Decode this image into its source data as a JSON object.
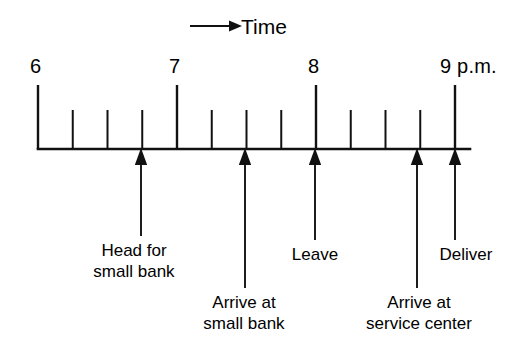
{
  "figure": {
    "type": "timeline",
    "caption": "Time",
    "direction_icon": "right-arrow-icon",
    "background_color": "#ffffff",
    "ink_color": "#111111"
  },
  "axis": {
    "baseline_y": 149,
    "x_start": 38,
    "x_end": 470,
    "hour_pixel_spacing": 139,
    "quarter_pixel_spacing": 34.75,
    "major_tick_height": 64,
    "minor_tick_height": 39,
    "hour_labels": [
      {
        "text": "6",
        "x": 38,
        "label_x": 30,
        "label_y": 56
      },
      {
        "text": "7",
        "x": 177,
        "label_x": 169,
        "label_y": 56
      },
      {
        "text": "8",
        "x": 316,
        "label_x": 308,
        "label_y": 56
      },
      {
        "text": "9 p.m.",
        "x": 455,
        "label_x": 440,
        "label_y": 56
      }
    ],
    "major_ticks": [
      38,
      177,
      316,
      455
    ],
    "minor_ticks": [
      72.75,
      107.5,
      142.25,
      211.75,
      246.5,
      281.25,
      350.75,
      385.5,
      420.25
    ]
  },
  "events": [
    {
      "name": "head-for-small-bank",
      "lines": [
        "Head for",
        "small bank"
      ],
      "arrow_x": 141,
      "stem_top_y": 236,
      "label_x": 134,
      "label_y": 240,
      "tier": "near"
    },
    {
      "name": "arrive-at-small-bank",
      "lines": [
        "Arrive at",
        "small bank"
      ],
      "arrow_x": 245,
      "stem_top_y": 288,
      "label_x": 244,
      "label_y": 292,
      "tier": "far"
    },
    {
      "name": "leave",
      "lines": [
        "Leave"
      ],
      "arrow_x": 315,
      "stem_top_y": 240,
      "label_x": 315,
      "label_y": 244,
      "tier": "near"
    },
    {
      "name": "arrive-at-service-center",
      "lines": [
        "Arrive at",
        "service center"
      ],
      "arrow_x": 417,
      "stem_top_y": 288,
      "label_x": 419,
      "label_y": 292,
      "tier": "far"
    },
    {
      "name": "deliver",
      "lines": [
        "Deliver"
      ],
      "arrow_x": 455,
      "stem_top_y": 240,
      "label_x": 466,
      "label_y": 244,
      "tier": "near"
    }
  ],
  "time_caption": {
    "text": "Time",
    "x": 241,
    "y": 16,
    "arrow_x1": 190,
    "arrow_x2": 232,
    "arrow_y": 26
  }
}
